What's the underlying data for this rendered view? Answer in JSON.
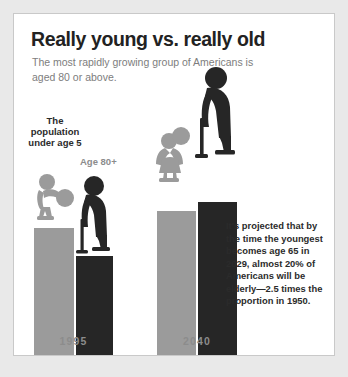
{
  "header": {
    "title": "Really young vs. really old",
    "subtitle": "The most rapidly growing group of Americans is aged 80 or above."
  },
  "labels": {
    "under_five": "The population under age 5",
    "eighty_plus": "Age 80+"
  },
  "projection": "It's projected that by the time the youngest becomes age 65 in 2029, almost 20% of Americans will be elderly—2.5 times the proportion in 1950.",
  "colors": {
    "young_bar": "#9b9b9b",
    "old_bar": "#262626",
    "card_background": "#ffffff",
    "page_background": "#e9e9e9",
    "title_text": "#222222",
    "subtitle_text": "#7d7d7d",
    "year_label_text": "#8c8c8c"
  },
  "chart_data": {
    "type": "bar",
    "title": "Really young vs. really old",
    "subtitle": "The most rapidly growing group of Americans is aged 80 or above.",
    "categories": [
      "1995",
      "2040"
    ],
    "xlabel": "",
    "ylabel": "",
    "grid": false,
    "legend_position": "inline-annotations",
    "series": [
      {
        "name": "The population under age 5",
        "color": "#9b9b9b",
        "values": [
          129,
          146
        ],
        "icon": "child-with-ball"
      },
      {
        "name": "Age 80+",
        "color": "#262626",
        "values": [
          101,
          155
        ],
        "icon": "elderly-person-with-cane"
      }
    ],
    "annotations": [
      "It's projected that by the time the youngest becomes age 65 in 2029, almost 20% of Americans will be elderly—2.5 times the proportion in 1950."
    ]
  }
}
